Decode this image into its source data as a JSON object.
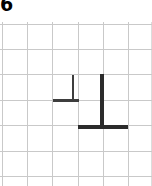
{
  "figure": {
    "label": "6",
    "label_icon": "figure-number-label",
    "background_color": "#ffffff",
    "grid": {
      "line_color": "#c9c9c9",
      "faint_line_color": "#dcdcdc",
      "cell_size_px": 25,
      "columns": 6,
      "rows": 7,
      "origin_x_px": 2,
      "origin_y_px": 2,
      "vertical_line_x": [
        2,
        27,
        52,
        78,
        103,
        128,
        151
      ],
      "horizontal_line_y": [
        2,
        27,
        52,
        78,
        103,
        129,
        154
      ]
    },
    "shapes": [
      {
        "name": "small-inverted-t",
        "type": "inverted-T",
        "color": "#3d3d3d",
        "stem": {
          "x": 72,
          "y": 53,
          "width": 2,
          "height": 26
        },
        "base": {
          "x": 53,
          "y": 77,
          "width": 26,
          "height": 3
        }
      },
      {
        "name": "large-inverted-t",
        "type": "inverted-T",
        "color": "#2b2b2b",
        "stem": {
          "x": 100,
          "y": 52,
          "width": 4,
          "height": 52
        },
        "base": {
          "x": 78,
          "y": 103,
          "width": 50,
          "height": 4
        }
      }
    ]
  }
}
